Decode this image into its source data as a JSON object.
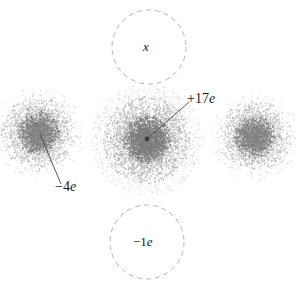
{
  "figure": {
    "name": "electron-cloud-charge-diagram",
    "background_color": "#ffffff",
    "width": 296,
    "height": 289
  },
  "labels": {
    "center_charge": "+17e",
    "left_charge": "−4e",
    "top_circle": "x",
    "bottom_circle": "−1e"
  },
  "colors": {
    "cloud_ink": "#6b6b6b",
    "cloud_ink_dense": "#4a4a4a",
    "dashed_circle_stroke": "#b9b4b4",
    "leader_line": "#4a4a4a",
    "nucleus_dot": "#3b3b3b",
    "label_text": "#1a1a1a"
  },
  "clouds": [
    {
      "name": "left-electron-cloud",
      "cx": 39,
      "cy": 133,
      "shells": [
        {
          "points": 2400,
          "sigma": 15,
          "radius": 38,
          "opacity": 0.4,
          "dot": 0.62
        },
        {
          "points": 1500,
          "sigma": 9,
          "radius": 22,
          "opacity": 0.55,
          "dot": 0.66
        },
        {
          "points": 900,
          "sigma": 26,
          "radius": 46,
          "opacity": 0.22,
          "dot": 0.58
        }
      ]
    },
    {
      "name": "center-electron-cloud",
      "cx": 147,
      "cy": 140,
      "shells": [
        {
          "points": 3400,
          "sigma": 19,
          "radius": 44,
          "opacity": 0.42,
          "dot": 0.64
        },
        {
          "points": 2000,
          "sigma": 10,
          "radius": 24,
          "opacity": 0.58,
          "dot": 0.68
        },
        {
          "points": 2600,
          "sigma": 36,
          "radius": 56,
          "opacity": 0.2,
          "dot": 0.58
        },
        {
          "points": 1200,
          "sigma": 48,
          "radius": 58,
          "opacity": 0.14,
          "dot": 0.55
        }
      ]
    },
    {
      "name": "right-electron-cloud",
      "cx": 255,
      "cy": 137,
      "shells": [
        {
          "points": 2300,
          "sigma": 15,
          "radius": 37,
          "opacity": 0.4,
          "dot": 0.62
        },
        {
          "points": 1400,
          "sigma": 9,
          "radius": 21,
          "opacity": 0.54,
          "dot": 0.66
        },
        {
          "points": 850,
          "sigma": 25,
          "radius": 44,
          "opacity": 0.22,
          "dot": 0.58
        }
      ]
    }
  ],
  "dashed_circles": [
    {
      "name": "top-dashed-circle",
      "cx": 149,
      "cy": 47,
      "r": 37
    },
    {
      "name": "bottom-dashed-circle",
      "cx": 147,
      "cy": 242,
      "r": 37
    }
  ],
  "leader_lines": [
    {
      "name": "center-charge-leader",
      "x1": 147,
      "y1": 139,
      "x2": 189,
      "y2": 102
    },
    {
      "name": "left-charge-leader",
      "x1": 40,
      "y1": 134,
      "x2": 61,
      "y2": 184
    }
  ],
  "nucleus_dot": {
    "name": "center-nucleus-dot",
    "cx": 147,
    "cy": 139,
    "r": 2.4
  }
}
